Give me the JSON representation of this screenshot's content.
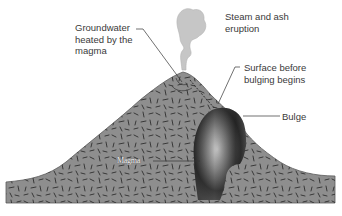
{
  "diagram": {
    "colors": {
      "rock": "#8e8e8e",
      "rock_outline": "#555555",
      "rock_flecks": "#2e2e2e",
      "magma_dark": "#2a2a2a",
      "magma_light": "#b5b5b5",
      "steam": "#c4c4c4",
      "leader_line": "#333333",
      "text": "#3a3a3a"
    },
    "labels": {
      "groundwater": "Groundwater\nheated by the\nmagma",
      "steam": "Steam and ash\neruption",
      "surface": "Surface before\nbulging begins",
      "bulge": "Bulge",
      "magma": "Magma"
    }
  }
}
